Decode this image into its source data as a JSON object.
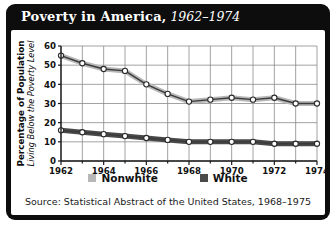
{
  "title": {
    "main": "Poverty in America,",
    "years": "1962–1974"
  },
  "chart_data": {
    "type": "line",
    "title": "Poverty in America, 1962–1974",
    "xlabel": "",
    "ylabel": "Percentage of Population Living Below the Poverty Level",
    "ylabel_line1": "Percentage of Population",
    "ylabel_line2": "Living Below the Poverty Level",
    "x": [
      1962,
      1963,
      1964,
      1965,
      1966,
      1967,
      1968,
      1969,
      1970,
      1971,
      1972,
      1973,
      1974
    ],
    "xtick_labels": [
      "1962",
      "1964",
      "1966",
      "1968",
      "1970",
      "1972",
      "1974"
    ],
    "xticks": [
      1962,
      1964,
      1966,
      1968,
      1970,
      1972,
      1974
    ],
    "yticks": [
      0,
      10,
      20,
      30,
      40,
      50,
      60
    ],
    "ytick_labels": [
      "0",
      "10",
      "20",
      "30",
      "40",
      "50",
      "60"
    ],
    "xlim": [
      1962,
      1974
    ],
    "ylim": [
      0,
      60
    ],
    "grid": true,
    "legend_position": "bottom",
    "series": [
      {
        "name": "Nonwhite",
        "color": "#b8b8b8",
        "values": [
          55,
          51,
          48,
          47,
          40,
          35,
          31,
          32,
          33,
          32,
          33,
          30,
          30
        ]
      },
      {
        "name": "White",
        "color": "#4a4a4a",
        "values": [
          16,
          15,
          14,
          13,
          12,
          11,
          10,
          10,
          10,
          10,
          9,
          9,
          9
        ]
      }
    ]
  },
  "source": {
    "prefix": "Source: ",
    "italic": "Statistical Abstract of the United States, 1968–1975"
  },
  "colors": {
    "frame": "#0d0d0d",
    "panel": "#ffffff",
    "nonwhite": "#b8b8b8",
    "white": "#4a4a4a",
    "grid": "#8a8a8a",
    "axis": "#1a1a1a"
  }
}
